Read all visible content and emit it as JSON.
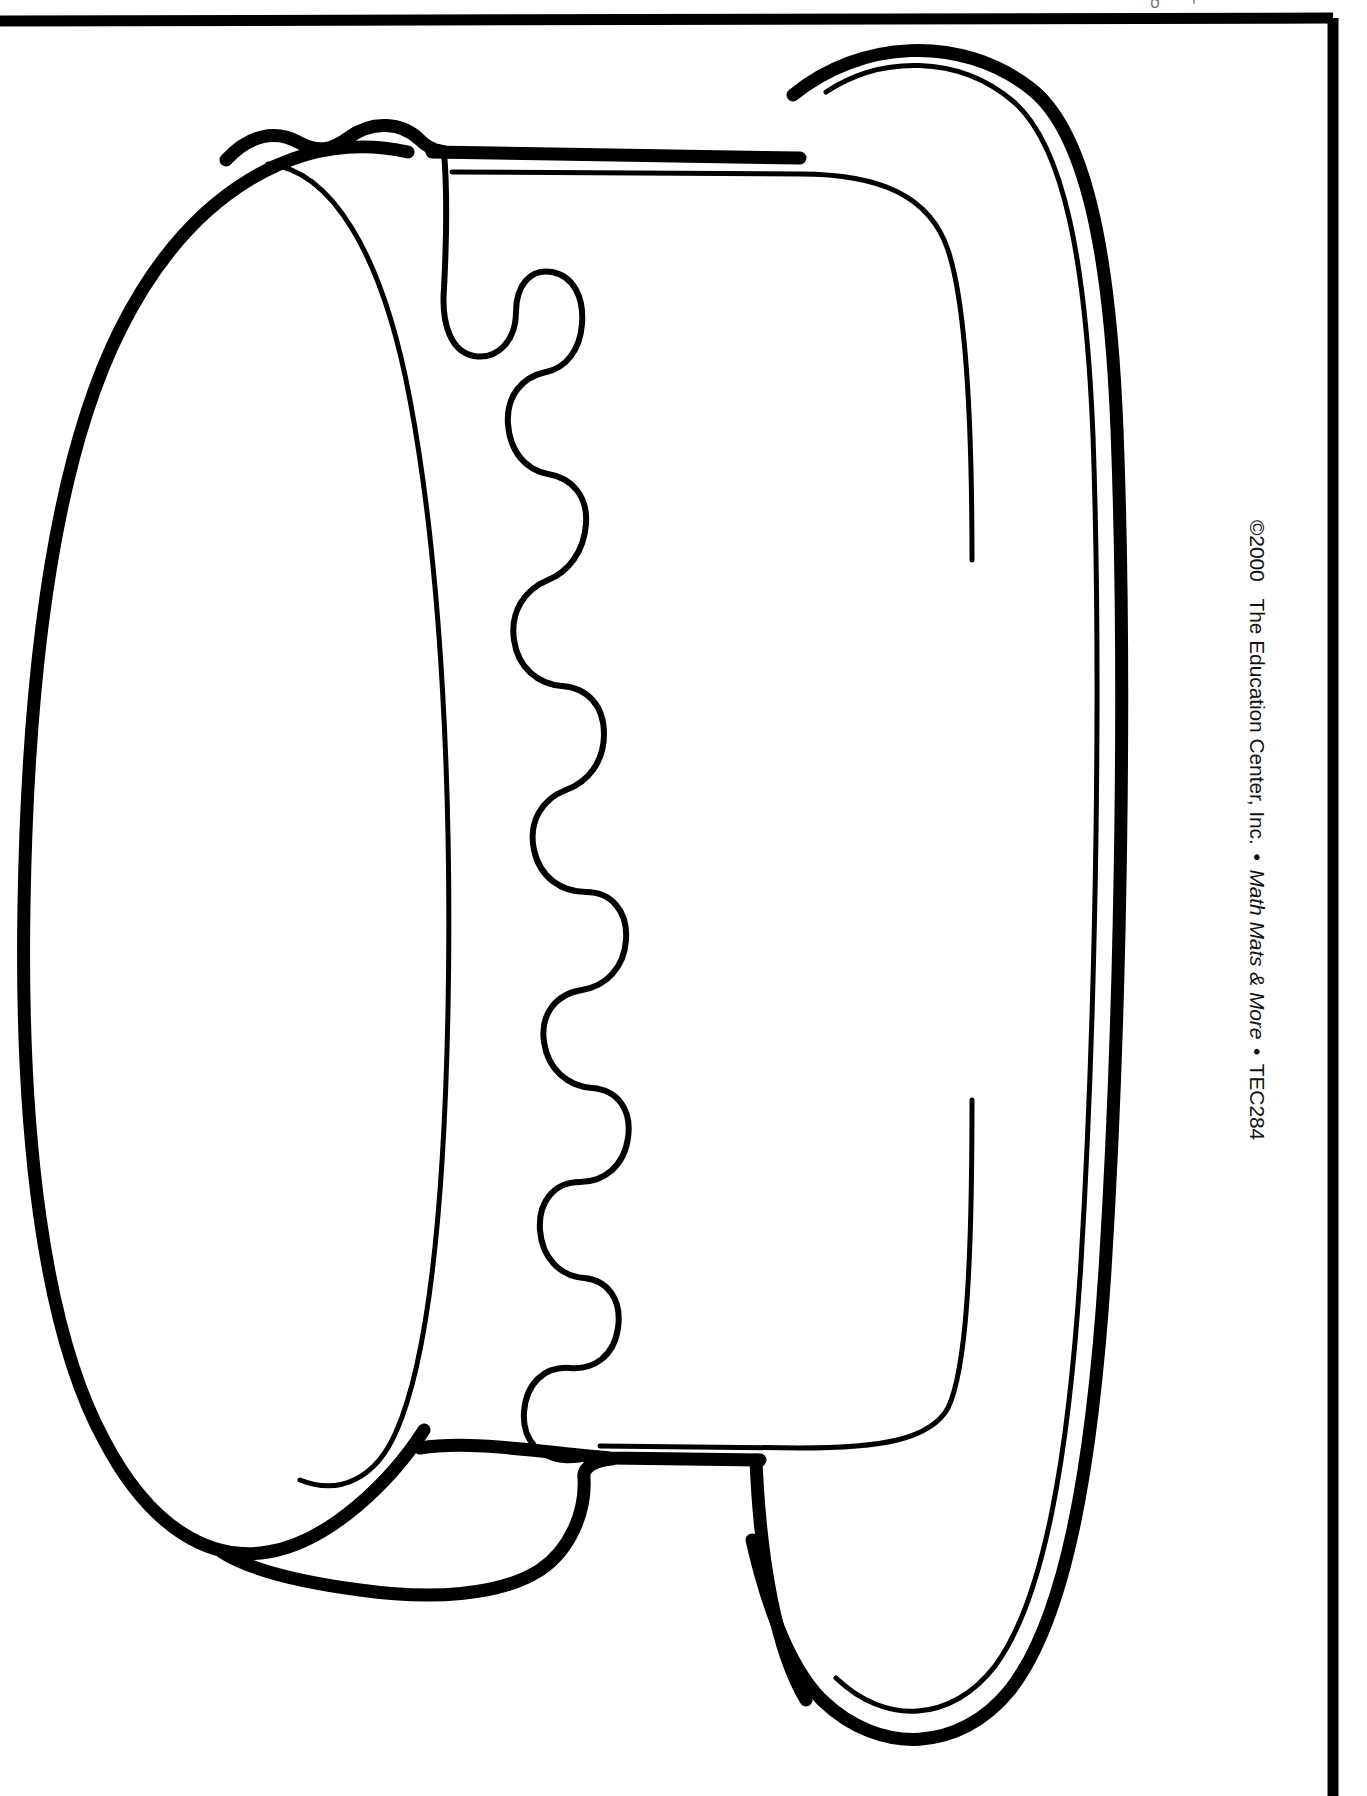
{
  "page": {
    "background_color": "#ffffff",
    "ink_color": "#000000",
    "width": 1367,
    "height": 1796
  },
  "top_artifact": {
    "text": "י ס"
  },
  "frame": {
    "name": "page-border",
    "stroke_color": "#000000"
  },
  "artwork": {
    "name": "cake-pattern",
    "description": "Large cylindrical cake (drum) outline drawn in black line art: a left end oval, a right end oval with a doubled rim line, a straight top and bottom band joining them, and a wavy drip / scalloped frosting edge running down the middle.",
    "stroke_color": "#000000",
    "fill_color": "#ffffff",
    "parts": [
      {
        "name": "left-end-oval-outer",
        "style": "thick-stroke"
      },
      {
        "name": "left-end-oval-inner",
        "style": "thin-stroke"
      },
      {
        "name": "right-end-oval-outer",
        "style": "thick-stroke"
      },
      {
        "name": "right-end-oval-inner-rim",
        "style": "thin-stroke"
      },
      {
        "name": "cylinder-top-band",
        "style": "thick-stroke"
      },
      {
        "name": "cylinder-bottom-band",
        "style": "thick-stroke"
      },
      {
        "name": "frosting-drip-wavy-edge",
        "style": "thin-stroke"
      }
    ]
  },
  "copyright": {
    "symbol_and_year": "©2000",
    "publisher": "The Education Center, Inc.",
    "separator": "•",
    "product_title": "Math Mats & More",
    "item_code": "TEC284",
    "full_text": "©2000 The Education Center, Inc. • Math Mats & More • TEC284",
    "orientation": "rotated-90-degrees-right-margin"
  }
}
